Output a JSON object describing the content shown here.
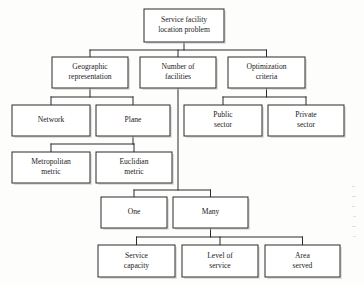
{
  "diagram": {
    "type": "hierarchy-tree",
    "orientation": "top-down",
    "colors": {
      "background": "#fdfdfc",
      "box_fill": "#ffffff",
      "box_stroke": "#2b2b2b",
      "connector": "#2b2b2b",
      "text": "#1b1b1b",
      "shadow": "#c9c9c6"
    },
    "nodes": [
      {
        "id": "root",
        "lines": [
          "Service facility",
          "location problem"
        ],
        "x": 144,
        "y": 9,
        "w": 80,
        "h": 33,
        "level": 0
      },
      {
        "id": "geographic-representation",
        "lines": [
          "Geographic",
          "representation"
        ],
        "x": 52,
        "y": 57,
        "w": 76,
        "h": 31,
        "level": 1
      },
      {
        "id": "number-of-facilities",
        "lines": [
          "Number of",
          "facilities"
        ],
        "x": 140,
        "y": 57,
        "w": 76,
        "h": 31,
        "level": 1
      },
      {
        "id": "optimization-criteria",
        "lines": [
          "Optimization",
          "criteria"
        ],
        "x": 228,
        "y": 57,
        "w": 77,
        "h": 31,
        "level": 1
      },
      {
        "id": "network",
        "lines": [
          "Network"
        ],
        "x": 12,
        "y": 105,
        "w": 78,
        "h": 31,
        "level": 2
      },
      {
        "id": "plane",
        "lines": [
          "Plane"
        ],
        "x": 96,
        "y": 105,
        "w": 74,
        "h": 31,
        "level": 2
      },
      {
        "id": "public-sector",
        "lines": [
          "Public",
          "sector"
        ],
        "x": 184,
        "y": 105,
        "w": 78,
        "h": 31,
        "level": 2
      },
      {
        "id": "private-sector",
        "lines": [
          "Private",
          "sector"
        ],
        "x": 268,
        "y": 105,
        "w": 76,
        "h": 31,
        "level": 2
      },
      {
        "id": "metropolitan-metric",
        "lines": [
          "Metropolitan",
          "metric"
        ],
        "x": 12,
        "y": 152,
        "w": 78,
        "h": 31,
        "level": 3
      },
      {
        "id": "euclidian-metric",
        "lines": [
          "Euclidian",
          "metric"
        ],
        "x": 96,
        "y": 152,
        "w": 76,
        "h": 31,
        "level": 3
      },
      {
        "id": "one",
        "lines": [
          "One"
        ],
        "x": 101,
        "y": 197,
        "w": 66,
        "h": 31,
        "level": 2
      },
      {
        "id": "many",
        "lines": [
          "Many"
        ],
        "x": 173,
        "y": 197,
        "w": 75,
        "h": 31,
        "level": 2
      },
      {
        "id": "service-capacity",
        "lines": [
          "Service",
          "capacity"
        ],
        "x": 98,
        "y": 245,
        "w": 77,
        "h": 32,
        "level": 3
      },
      {
        "id": "level-of-service",
        "lines": [
          "Level of",
          "service"
        ],
        "x": 182,
        "y": 245,
        "w": 76,
        "h": 32,
        "level": 3
      },
      {
        "id": "area-served",
        "lines": [
          "Area",
          "served"
        ],
        "x": 265,
        "y": 245,
        "w": 75,
        "h": 32,
        "level": 3
      }
    ],
    "edges": [
      {
        "id": "root-to-branches",
        "from": "root",
        "to": [
          "geographic-representation",
          "number-of-facilities",
          "optimization-criteria"
        ],
        "bus_y": 50
      },
      {
        "id": "geographic-to-representations",
        "from": "geographic-representation",
        "to": [
          "network",
          "plane"
        ],
        "bus_y": 97
      },
      {
        "id": "optimization-to-sectors",
        "from": "optimization-criteria",
        "to": [
          "public-sector",
          "private-sector"
        ],
        "bus_y": 97
      },
      {
        "id": "plane-to-metrics",
        "from": "plane",
        "to": [
          "metropolitan-metric",
          "euclidian-metric"
        ],
        "bus_y": 144
      },
      {
        "id": "facilities-to-counts",
        "from": "number-of-facilities",
        "to": [
          "one",
          "many"
        ],
        "bus_y": 190
      },
      {
        "id": "many-to-attributes",
        "from": "many",
        "to": [
          "service-capacity",
          "level-of-service",
          "area-served"
        ],
        "bus_y": 237
      }
    ]
  }
}
